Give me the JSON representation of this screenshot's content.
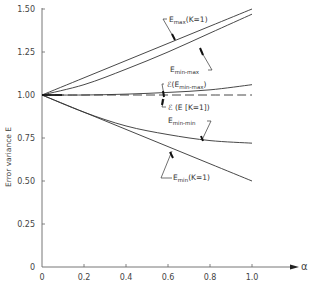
{
  "chart_data": {
    "type": "line",
    "title": "",
    "xlabel": "α",
    "ylabel": "Error variance E",
    "xlim": [
      0,
      1.0
    ],
    "ylim": [
      0,
      1.5
    ],
    "grid": false,
    "legend_position": "inline annotations",
    "x_ticks": [
      "0",
      "0.2",
      "0.4",
      "0.6",
      "0.8",
      "1.0"
    ],
    "y_ticks": [
      "0",
      "0.25",
      "0.50",
      "0.75",
      "1.00",
      "1.25",
      "1.50"
    ],
    "x": [
      0,
      0.2,
      0.4,
      0.6,
      0.8,
      1.0
    ],
    "series": [
      {
        "name": "Emax(K=1)",
        "label_main": "E",
        "label_sub": "max",
        "label_tail": "(K=1)",
        "style": "solid",
        "values": [
          1.0,
          1.1,
          1.2,
          1.3,
          1.4,
          1.5
        ]
      },
      {
        "name": "Emin-max",
        "label_main": "E",
        "label_sub": "min-max",
        "label_tail": "",
        "style": "solid",
        "values": [
          1.0,
          1.06,
          1.15,
          1.25,
          1.36,
          1.47
        ]
      },
      {
        "name": "ℰ(Emin-max)",
        "label_main": "ℰ(E",
        "label_sub": "min-max",
        "label_tail": ")",
        "style": "solid",
        "values": [
          1.0,
          1.0,
          1.005,
          1.015,
          1.03,
          1.06
        ]
      },
      {
        "name": "ℰ(E[K=1])",
        "label_main": "ℰ (E [K=1])",
        "label_sub": "",
        "label_tail": "",
        "style": "dashed",
        "values": [
          1.0,
          1.0,
          1.0,
          1.0,
          1.0,
          1.0
        ]
      },
      {
        "name": "Emin-min",
        "label_main": "E",
        "label_sub": "min-min",
        "label_tail": "",
        "style": "solid",
        "values": [
          1.0,
          0.9,
          0.82,
          0.77,
          0.735,
          0.72
        ]
      },
      {
        "name": "Emin(K=1)",
        "label_main": "E",
        "label_sub": "min",
        "label_tail": "(K=1)",
        "style": "solid",
        "values": [
          1.0,
          0.9,
          0.8,
          0.7,
          0.6,
          0.5
        ]
      }
    ]
  }
}
